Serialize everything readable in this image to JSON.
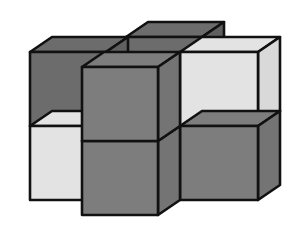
{
  "diagram": {
    "title": "",
    "palette": {
      "dark": "#6c6c6c",
      "dark_side": "#606060",
      "medium": "#7d7d7d",
      "medium_side": "#747474",
      "light": "#e3e3e3",
      "light_side": "#d9d9d9",
      "outline": "#111111",
      "background": "#ffffff"
    },
    "cubes": [
      {
        "id": "back-center-top",
        "col": 1,
        "row": 1,
        "depth": 1,
        "shade": "dark"
      },
      {
        "id": "left-top",
        "col": 0,
        "row": 1,
        "depth": 0,
        "shade": "dark"
      },
      {
        "id": "left-bottom",
        "col": 0,
        "row": 0,
        "depth": 0,
        "shade": "light"
      },
      {
        "id": "right-top",
        "col": 2,
        "row": 1,
        "depth": 0,
        "shade": "light"
      },
      {
        "id": "right-bottom",
        "col": 2,
        "row": 0,
        "depth": 0,
        "shade": "medium"
      },
      {
        "id": "front-top",
        "col": 1,
        "row": 1,
        "depth": -1,
        "shade": "medium"
      },
      {
        "id": "front-bottom",
        "col": 1,
        "row": 0,
        "depth": -1,
        "shade": "medium"
      }
    ]
  }
}
